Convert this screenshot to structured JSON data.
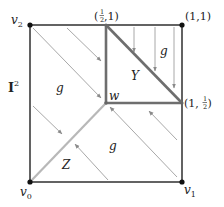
{
  "diagram": {
    "space_label": "I",
    "space_superscript": "2",
    "vertices": {
      "v0": {
        "label": "v",
        "sub": "0"
      },
      "v1": {
        "label": "v",
        "sub": "1"
      },
      "v2": {
        "label": "v",
        "sub": "2"
      },
      "top_right": {
        "label": "(1,1)"
      },
      "mid_top": {
        "prefix": "(",
        "frac_num": "1",
        "frac_den": "2",
        "suffix": ",1)"
      },
      "mid_right": {
        "prefix": "(1,",
        "frac_num": "1",
        "frac_den": "2",
        "suffix": ")"
      },
      "center": {
        "label": "w"
      }
    },
    "regions": {
      "Y": "Y",
      "Z": "Z",
      "g_top_left": "g",
      "g_top_right": "g",
      "g_bottom_right": "g"
    },
    "colors": {
      "frame": "#222222",
      "triangle_Y": "#707070",
      "diagonal_Z": "#b5b5b5",
      "arrows": "#9a9a9a"
    }
  }
}
